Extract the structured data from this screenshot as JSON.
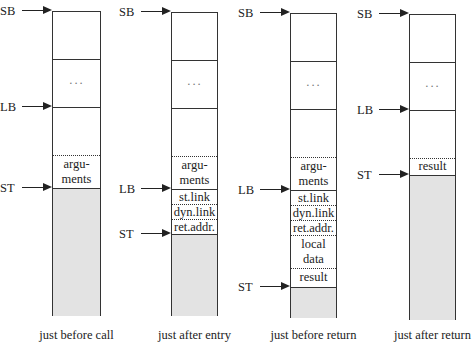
{
  "diagram": {
    "title": "",
    "columns": [
      {
        "caption": "just before call",
        "left": 52,
        "width": 49,
        "top": 11,
        "bottom": 316,
        "cells": [
          {
            "top": 11,
            "height": 48,
            "border": "solid",
            "lines": [
              ""
            ]
          },
          {
            "top": 59,
            "height": 48,
            "border": "solid",
            "lines": [
              "..."
            ]
          },
          {
            "top": 107,
            "height": 48,
            "border": "solid",
            "lines": [
              ""
            ]
          },
          {
            "top": 155,
            "height": 33,
            "border": "dotted",
            "lines": [
              "argu-",
              "ments"
            ]
          },
          {
            "top": 188,
            "height": 128,
            "border": "solid",
            "lines": [
              ""
            ],
            "shaded": true
          }
        ],
        "pointers": [
          {
            "label": "SB",
            "y": 11
          },
          {
            "label": "LB",
            "y": 107
          },
          {
            "label": "ST",
            "y": 188
          }
        ]
      },
      {
        "caption": "just after entry",
        "left": 171,
        "width": 47,
        "top": 12,
        "bottom": 316,
        "cells": [
          {
            "top": 12,
            "height": 48,
            "border": "solid",
            "lines": [
              ""
            ]
          },
          {
            "top": 60,
            "height": 48,
            "border": "solid",
            "lines": [
              "..."
            ]
          },
          {
            "top": 108,
            "height": 48,
            "border": "solid",
            "lines": [
              ""
            ]
          },
          {
            "top": 156,
            "height": 33,
            "border": "dotted",
            "lines": [
              "argu-",
              "ments"
            ]
          },
          {
            "top": 189,
            "height": 15,
            "border": "solid",
            "lines": [
              "st.link"
            ]
          },
          {
            "top": 204,
            "height": 15,
            "border": "dotted",
            "lines": [
              "dyn.link"
            ]
          },
          {
            "top": 219,
            "height": 15,
            "border": "dotted",
            "lines": [
              "ret.addr."
            ]
          },
          {
            "top": 234,
            "height": 82,
            "border": "solid",
            "lines": [
              ""
            ],
            "shaded": true
          }
        ],
        "pointers": [
          {
            "label": "SB",
            "y": 12
          },
          {
            "label": "LB",
            "y": 189
          },
          {
            "label": "ST",
            "y": 234
          }
        ]
      },
      {
        "caption": "just before return",
        "left": 290,
        "width": 47,
        "top": 13,
        "bottom": 318,
        "cells": [
          {
            "top": 13,
            "height": 48,
            "border": "solid",
            "lines": [
              ""
            ]
          },
          {
            "top": 61,
            "height": 48,
            "border": "solid",
            "lines": [
              "..."
            ]
          },
          {
            "top": 109,
            "height": 48,
            "border": "solid",
            "lines": [
              ""
            ]
          },
          {
            "top": 157,
            "height": 33,
            "border": "dotted",
            "lines": [
              "argu-",
              "ments"
            ]
          },
          {
            "top": 190,
            "height": 15,
            "border": "solid",
            "lines": [
              "st.link"
            ]
          },
          {
            "top": 205,
            "height": 15,
            "border": "dotted",
            "lines": [
              "dyn.link"
            ]
          },
          {
            "top": 220,
            "height": 15,
            "border": "dotted",
            "lines": [
              "ret.addr."
            ]
          },
          {
            "top": 235,
            "height": 33,
            "border": "dotted",
            "lines": [
              "local",
              "data"
            ]
          },
          {
            "top": 268,
            "height": 19,
            "border": "dotted",
            "lines": [
              "result"
            ]
          },
          {
            "top": 287,
            "height": 31,
            "border": "solid",
            "lines": [
              ""
            ],
            "shaded": true
          }
        ],
        "pointers": [
          {
            "label": "SB",
            "y": 13
          },
          {
            "label": "LB",
            "y": 190
          },
          {
            "label": "ST",
            "y": 287
          }
        ]
      },
      {
        "caption": "just after return",
        "left": 409,
        "width": 47,
        "top": 14,
        "bottom": 320,
        "cells": [
          {
            "top": 14,
            "height": 48,
            "border": "solid",
            "lines": [
              ""
            ]
          },
          {
            "top": 62,
            "height": 48,
            "border": "solid",
            "lines": [
              "..."
            ]
          },
          {
            "top": 110,
            "height": 48,
            "border": "solid",
            "lines": [
              ""
            ]
          },
          {
            "top": 158,
            "height": 17,
            "border": "dotted",
            "lines": [
              "result"
            ]
          },
          {
            "top": 175,
            "height": 145,
            "border": "solid",
            "lines": [
              ""
            ],
            "shaded": true
          }
        ],
        "pointers": [
          {
            "label": "SB",
            "y": 14
          },
          {
            "label": "LB",
            "y": 110
          },
          {
            "label": "ST",
            "y": 175
          }
        ]
      }
    ],
    "captions": [
      "just before call",
      "just after entry",
      "just before return",
      "just after return"
    ],
    "colors": {
      "line": "#333333",
      "shaded": "#e3e3e3",
      "background": "#ffffff"
    }
  }
}
